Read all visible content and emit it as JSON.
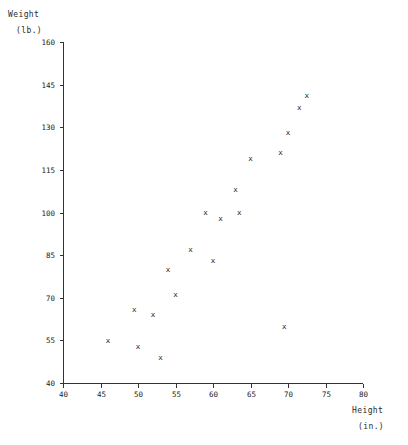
{
  "chart_data": {
    "type": "scatter",
    "title": "",
    "xlabel": "Height (in.)",
    "ylabel": "Weight (lb.)",
    "xlabel_lines": [
      "Height",
      "(in.)"
    ],
    "ylabel_lines": [
      "Weight",
      "(lb.)"
    ],
    "xlim": [
      40,
      80
    ],
    "ylim": [
      40,
      160
    ],
    "xticks": [
      40,
      45,
      50,
      55,
      60,
      65,
      70,
      75,
      80
    ],
    "yticks": [
      40,
      55,
      70,
      85,
      100,
      115,
      130,
      145,
      160
    ],
    "xtick_labels": [
      "40",
      "45",
      "50",
      "55",
      "60",
      "65",
      "70",
      "75",
      "80"
    ],
    "ytick_labels": [
      "40",
      "55",
      "70",
      "85",
      "100",
      "115",
      "130",
      "145",
      "160"
    ],
    "grid": false,
    "legend": null,
    "marker": "x",
    "marker_color": "#111111",
    "axis_color": "#333333",
    "background": "#ffffff",
    "series": [
      {
        "name": "height-weight",
        "points": [
          {
            "x": 46.0,
            "y": 55
          },
          {
            "x": 49.5,
            "y": 66
          },
          {
            "x": 50.0,
            "y": 53
          },
          {
            "x": 52.0,
            "y": 64
          },
          {
            "x": 53.0,
            "y": 49
          },
          {
            "x": 54.0,
            "y": 80
          },
          {
            "x": 55.0,
            "y": 71
          },
          {
            "x": 57.0,
            "y": 87
          },
          {
            "x": 59.0,
            "y": 100
          },
          {
            "x": 60.0,
            "y": 83
          },
          {
            "x": 61.0,
            "y": 98
          },
          {
            "x": 63.0,
            "y": 108
          },
          {
            "x": 63.5,
            "y": 100
          },
          {
            "x": 65.0,
            "y": 119
          },
          {
            "x": 69.0,
            "y": 121
          },
          {
            "x": 69.5,
            "y": 60
          },
          {
            "x": 70.0,
            "y": 128
          },
          {
            "x": 71.5,
            "y": 137
          },
          {
            "x": 72.5,
            "y": 141
          }
        ]
      }
    ]
  },
  "plot_geometry": {
    "left_px": 63,
    "bottom_px": 383,
    "top_px": 42,
    "right_px": 363,
    "tick_length_px": 4
  }
}
